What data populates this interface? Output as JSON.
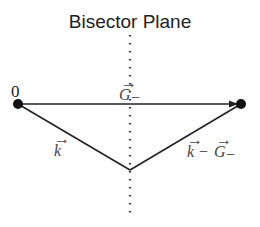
{
  "diagram": {
    "title": "Bisector Plane",
    "origin_label": "0",
    "vectors": [
      {
        "name": "G-minus",
        "label_base": "G",
        "label_sub": "−",
        "from": "origin",
        "to": "right-point"
      },
      {
        "name": "k",
        "label_base": "k",
        "from": "origin",
        "to": "bisector-vertex"
      },
      {
        "name": "k-minus-G-minus",
        "label_k": "k",
        "label_op": "−",
        "label_G": "G",
        "label_sub": "−",
        "from": "bisector-vertex",
        "to": "right-point"
      }
    ],
    "arrow_glyph": "→",
    "colors": {
      "line": "#222222",
      "text": "#444444",
      "dot": "#111111"
    }
  }
}
